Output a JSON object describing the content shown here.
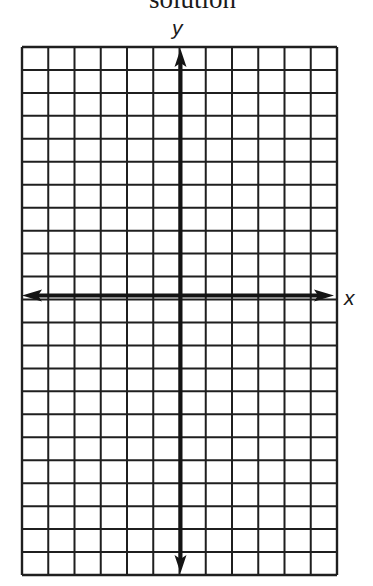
{
  "header": {
    "title": "solution"
  },
  "graph": {
    "x_axis_label": "x",
    "y_axis_label": "y",
    "columns": 12,
    "rows": 23,
    "y_axis_column_index": 6,
    "x_axis_row_index": 11,
    "grid_color": "#1f1f1f",
    "axis_color": "#141414"
  }
}
